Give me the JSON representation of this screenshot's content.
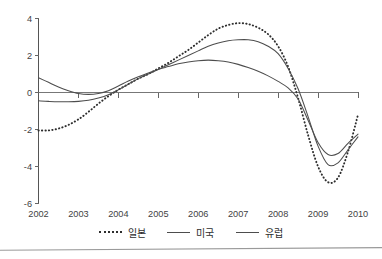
{
  "chart_data": {
    "type": "line",
    "title": "",
    "xlabel": "",
    "ylabel": "",
    "xlim": [
      2002,
      2010
    ],
    "ylim": [
      -6,
      4
    ],
    "grid": false,
    "zero_line": true,
    "legend_position": "bottom",
    "x_tick_labels": [
      "2002",
      "2003",
      "2004",
      "2005",
      "2006",
      "2007",
      "2008",
      "2009",
      "2010"
    ],
    "y_tick_labels": [
      "4",
      "2",
      "0",
      "-2",
      "-4",
      "-6"
    ],
    "y_ticks": [
      4,
      2,
      0,
      -2,
      -4,
      -6
    ],
    "x": [
      2002.0,
      2002.25,
      2002.5,
      2002.75,
      2003.0,
      2003.25,
      2003.5,
      2003.75,
      2004.0,
      2004.25,
      2004.5,
      2004.75,
      2005.0,
      2005.25,
      2005.5,
      2005.75,
      2006.0,
      2006.25,
      2006.5,
      2006.75,
      2007.0,
      2007.25,
      2007.5,
      2007.75,
      2008.0,
      2008.25,
      2008.5,
      2008.75,
      2009.0,
      2009.25,
      2009.5,
      2009.75,
      2010.0
    ],
    "series": [
      {
        "name": "일본",
        "style": "dotted",
        "color": "#2e2e2e",
        "values": [
          -2.05,
          -2.05,
          -1.95,
          -1.75,
          -1.45,
          -1.05,
          -0.6,
          -0.2,
          0.15,
          0.45,
          0.75,
          1.0,
          1.3,
          1.6,
          1.95,
          2.3,
          2.7,
          3.1,
          3.45,
          3.65,
          3.75,
          3.7,
          3.5,
          3.15,
          2.5,
          1.4,
          -0.3,
          -2.3,
          -4.0,
          -4.85,
          -4.6,
          -3.2,
          -1.2
        ]
      },
      {
        "name": "미국",
        "style": "solid",
        "color": "#4d4d4d",
        "values": [
          -0.45,
          -0.48,
          -0.5,
          -0.5,
          -0.48,
          -0.42,
          -0.3,
          -0.12,
          0.15,
          0.45,
          0.75,
          1.0,
          1.25,
          1.5,
          1.75,
          2.0,
          2.25,
          2.5,
          2.68,
          2.8,
          2.85,
          2.85,
          2.75,
          2.5,
          2.1,
          1.3,
          0.2,
          -1.3,
          -2.9,
          -3.9,
          -3.8,
          -3.1,
          -2.4
        ]
      },
      {
        "name": "유럽",
        "style": "solid",
        "color": "#606060",
        "values": [
          0.8,
          0.55,
          0.3,
          0.1,
          -0.05,
          -0.1,
          -0.05,
          0.1,
          0.35,
          0.62,
          0.85,
          1.05,
          1.25,
          1.4,
          1.55,
          1.65,
          1.72,
          1.75,
          1.72,
          1.65,
          1.52,
          1.35,
          1.15,
          0.9,
          0.6,
          0.25,
          -0.35,
          -1.5,
          -2.7,
          -3.35,
          -3.3,
          -2.75,
          -2.25
        ]
      }
    ]
  },
  "legend": {
    "items": [
      {
        "label": "일본",
        "style": "dotted"
      },
      {
        "label": "미국",
        "style": "solid"
      },
      {
        "label": "유럽",
        "style": "solid"
      }
    ]
  }
}
